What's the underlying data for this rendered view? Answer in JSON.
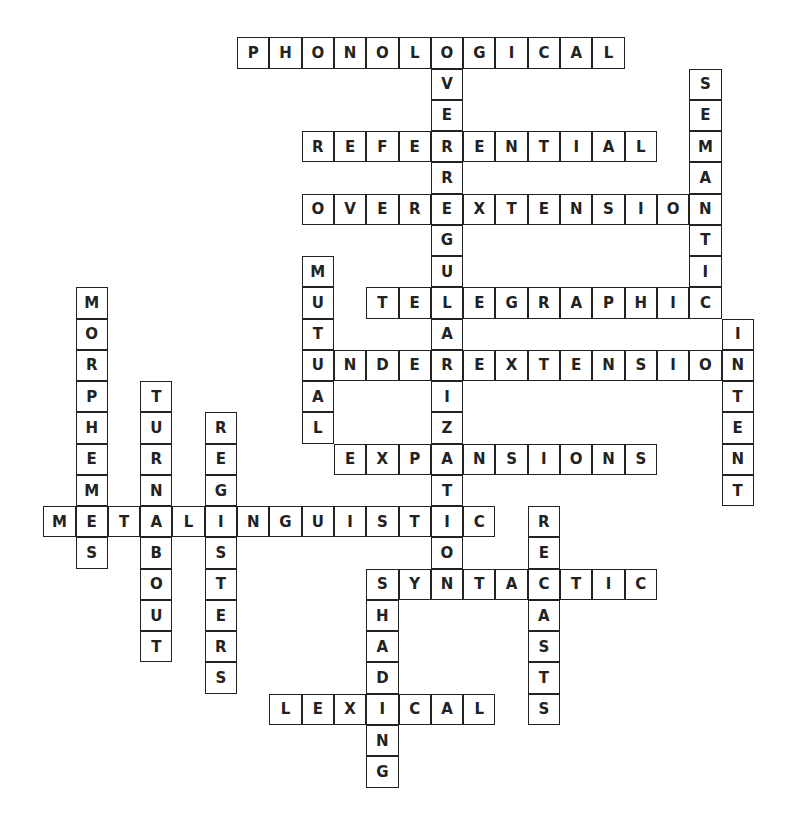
{
  "puzzle": {
    "type": "crossword",
    "origin": {
      "x": 44,
      "y": 38
    },
    "cell_size": {
      "w": 32.3,
      "h": 31.26
    },
    "colors": {
      "border": "#222222",
      "text": "#222222",
      "background": "#ffffff"
    },
    "words": [
      {
        "word": "PHONOLOGICAL",
        "dir": "across",
        "row": 0,
        "col": 6
      },
      {
        "word": "REFERENTIAL",
        "dir": "across",
        "row": 3,
        "col": 8
      },
      {
        "word": "OVEREXTENSION",
        "dir": "across",
        "row": 5,
        "col": 8
      },
      {
        "word": "TELEGRAPHIC",
        "dir": "across",
        "row": 8,
        "col": 10
      },
      {
        "word": "UNDEREXTENSION",
        "dir": "across",
        "row": 10,
        "col": 8
      },
      {
        "word": "EXPANSIONS",
        "dir": "across",
        "row": 13,
        "col": 9
      },
      {
        "word": "METALINGUISTIC",
        "dir": "across",
        "row": 15,
        "col": 0
      },
      {
        "word": "SYNTACTIC",
        "dir": "across",
        "row": 17,
        "col": 10
      },
      {
        "word": "LEXICAL",
        "dir": "across",
        "row": 21,
        "col": 7
      },
      {
        "word": "OVERREGULARIZATION",
        "dir": "down",
        "row": 0,
        "col": 12
      },
      {
        "word": "SEMANTIC",
        "dir": "down",
        "row": 1,
        "col": 20
      },
      {
        "word": "MUTUAL",
        "dir": "down",
        "row": 7,
        "col": 8
      },
      {
        "word": "MORPHEMES",
        "dir": "down",
        "row": 8,
        "col": 1
      },
      {
        "word": "INTENT",
        "dir": "down",
        "row": 9,
        "col": 21
      },
      {
        "word": "TURNABOUT",
        "dir": "down",
        "row": 11,
        "col": 3
      },
      {
        "word": "REGISTERS",
        "dir": "down",
        "row": 12,
        "col": 5
      },
      {
        "word": "RECASTS",
        "dir": "down",
        "row": 15,
        "col": 15
      },
      {
        "word": "SHADING",
        "dir": "down",
        "row": 17,
        "col": 10
      }
    ]
  }
}
